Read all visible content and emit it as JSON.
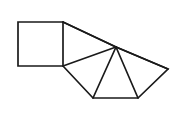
{
  "figure": {
    "title": "Geometric fan of triangles with attached square",
    "type": "line-drawing",
    "background_color": "#ffffff",
    "stroke_color": "#1a1a1a",
    "fill_color": "#ffffff",
    "stroke_width": 1.7,
    "canvas": {
      "width": 184,
      "height": 121
    },
    "vertices": {
      "square_top_left": {
        "x": 18,
        "y": 22
      },
      "square_top_right": {
        "x": 63,
        "y": 22
      },
      "square_bottom_right": {
        "x": 63,
        "y": 66
      },
      "square_bottom_left": {
        "x": 18,
        "y": 66
      },
      "hub_apex": {
        "x": 116,
        "y": 47
      },
      "base_left": {
        "x": 93,
        "y": 98
      },
      "base_right": {
        "x": 138,
        "y": 98
      },
      "right_tip": {
        "x": 168,
        "y": 69
      }
    },
    "parts": [
      {
        "name": "square",
        "label": "Square",
        "points": "18,22 63,22 63,66 18,66"
      },
      {
        "name": "upper-triangle",
        "label": "Upper triangle",
        "points": "63,22 116,47 63,66"
      },
      {
        "name": "left-triangle",
        "label": "Left triangle",
        "points": "63,66 116,47 93,98"
      },
      {
        "name": "center-triangle",
        "label": "Center triangle",
        "points": "93,98 116,47 138,98"
      },
      {
        "name": "right-triangle",
        "label": "Right triangle",
        "points": "138,98 116,47 168,69"
      }
    ],
    "outline": {
      "name": "figure-outline",
      "points": "18,22 63,22 116,47 168,69 138,98 93,98 63,66 18,66"
    },
    "spokes": [
      {
        "name": "spoke-to-square-top",
        "x1": 116,
        "y1": 47,
        "x2": 63,
        "y2": 22
      },
      {
        "name": "spoke-to-square-bottom",
        "x1": 116,
        "y1": 47,
        "x2": 63,
        "y2": 66
      },
      {
        "name": "spoke-to-base-left",
        "x1": 116,
        "y1": 47,
        "x2": 93,
        "y2": 98
      },
      {
        "name": "spoke-to-base-right",
        "x1": 116,
        "y1": 47,
        "x2": 138,
        "y2": 98
      },
      {
        "name": "spoke-to-right-tip",
        "x1": 116,
        "y1": 47,
        "x2": 168,
        "y2": 69
      }
    ]
  }
}
